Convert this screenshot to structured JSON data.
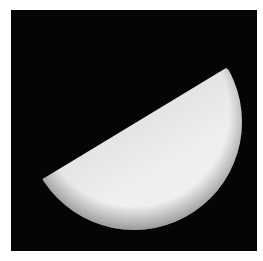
{
  "image": {
    "subject": "half-illuminated planet",
    "background_color": "#050505",
    "border_color": "#ffffff",
    "colors": {
      "terminator_dark": "#5a5a5a",
      "mid": "#b0b0b0",
      "bright": "#f0f0f0"
    }
  }
}
